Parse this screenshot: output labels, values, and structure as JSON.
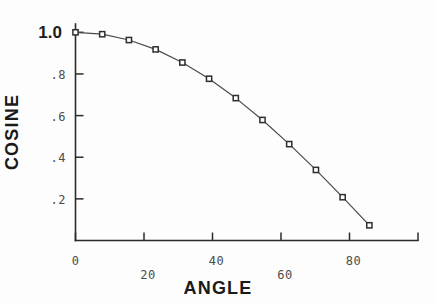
{
  "chart_data": {
    "type": "line",
    "title": "",
    "xlabel": "ANGLE",
    "ylabel": "COSINE",
    "xlim": [
      0,
      100
    ],
    "ylim": [
      0,
      1.04
    ],
    "grid": false,
    "legend": null,
    "markers": "square",
    "x_ticks": [
      {
        "value": 0,
        "label": "0"
      },
      {
        "value": 20,
        "label": "20"
      },
      {
        "value": 40,
        "label": "40"
      },
      {
        "value": 60,
        "label": "60"
      },
      {
        "value": 80,
        "label": "80"
      },
      {
        "value": 100,
        "label": ""
      }
    ],
    "y_ticks": [
      {
        "value": 1.0,
        "label": "1.0"
      },
      {
        "value": 0.8,
        "label": ".8"
      },
      {
        "value": 0.6,
        "label": ".6"
      },
      {
        "value": 0.4,
        "label": ".4"
      },
      {
        "value": 0.2,
        "label": ".2"
      }
    ],
    "series": [
      {
        "name": "cosine",
        "x": [
          0,
          7.8,
          15.6,
          23.4,
          31.2,
          39,
          46.8,
          54.6,
          62.4,
          70.2,
          78,
          85.8
        ],
        "values": [
          1.0,
          0.991,
          0.963,
          0.918,
          0.855,
          0.777,
          0.684,
          0.579,
          0.463,
          0.339,
          0.208,
          0.073
        ]
      }
    ]
  },
  "axes": {
    "x_title": "ANGLE",
    "y_title": "COSINE"
  }
}
